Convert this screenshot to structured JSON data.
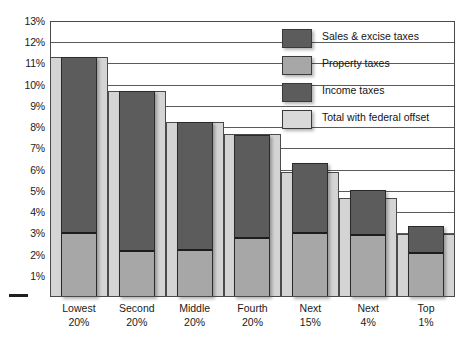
{
  "chart_data": {
    "type": "bar",
    "title": "",
    "subtitle": "",
    "xlabel": "",
    "ylabel": "",
    "ylim": [
      0,
      13
    ],
    "grid": true,
    "legend_position": "inside-top-right",
    "categories": [
      "Lowest 20%",
      "Second 20%",
      "Middle 20%",
      "Fourth 20%",
      "Next 15%",
      "Next 4%",
      "Top 1%"
    ],
    "category_lines": [
      [
        "Lowest",
        "20%"
      ],
      [
        "Second",
        "20%"
      ],
      [
        "Middle",
        "20%"
      ],
      [
        "Fourth",
        "20%"
      ],
      [
        "Next",
        "15%"
      ],
      [
        "Next",
        "4%"
      ],
      [
        "Top",
        "1%"
      ]
    ],
    "ytick_labels": [
      "13%",
      "12%",
      "11%",
      "10%",
      "9%",
      "8%",
      "7%",
      "6%",
      "5%",
      "4%",
      "3%",
      "2%",
      "1%"
    ],
    "yticks": [
      13,
      12,
      11,
      10,
      9,
      8,
      7,
      6,
      5,
      4,
      3,
      2,
      1
    ],
    "series": [
      {
        "name": "Sales & excise taxes",
        "color": "#5c5c5c",
        "values": [
          8.3,
          7.55,
          6.05,
          4.85,
          3.3,
          2.15,
          1.3
        ]
      },
      {
        "name": "Property taxes",
        "color": "#a7a7a7",
        "values": [
          3.0,
          2.15,
          2.2,
          2.8,
          3.0,
          2.9,
          2.05
        ]
      },
      {
        "name": "Income taxes",
        "color": "#5c5c5c",
        "values": [
          8.3,
          7.55,
          6.05,
          4.85,
          3.3,
          2.15,
          1.3
        ]
      },
      {
        "name": "Total with federal offset",
        "color": "#d4d4d4",
        "values": [
          11.3,
          9.7,
          8.25,
          7.7,
          5.9,
          4.65,
          2.95
        ]
      }
    ],
    "bar_totals": [
      11.3,
      9.7,
      8.25,
      7.65,
      6.3,
      5.05,
      3.35
    ],
    "annotations": []
  },
  "legend": {
    "items": [
      {
        "label": "Sales & excise taxes",
        "color": "#5c5c5c"
      },
      {
        "label": "Property taxes",
        "color": "#a7a7a7"
      },
      {
        "label": "Income taxes",
        "color": "#5c5c5c"
      },
      {
        "label": "Total with federal offset",
        "color": "#d9d9d9"
      }
    ]
  }
}
